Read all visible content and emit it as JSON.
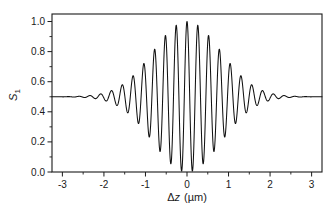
{
  "chart_data": {
    "type": "line",
    "title": "",
    "subtitle": "",
    "xlabel": "Δz (µm)",
    "xlabel_parts": {
      "delta": "Δ",
      "variable": "z",
      "unit": "(µm)"
    },
    "ylabel": "S1",
    "ylabel_parts": {
      "symbol": "S",
      "subscript": "1"
    },
    "xlim": [
      -3.25,
      3.25
    ],
    "ylim": [
      0.0,
      1.05
    ],
    "xticks": [
      -3,
      -2,
      -1,
      0,
      1,
      2,
      3
    ],
    "xticklabels": [
      "-3",
      "-2",
      "-1",
      "0",
      "1",
      "2",
      "3"
    ],
    "xminorticks": [
      -2.5,
      -1.5,
      -0.5,
      0.5,
      1.5,
      2.5
    ],
    "yticks": [
      0.0,
      0.2,
      0.4,
      0.6,
      0.8,
      1.0
    ],
    "yticklabels": [
      "0.0",
      "0.2",
      "0.4",
      "0.6",
      "0.8",
      "1.0"
    ],
    "grid": false,
    "legend": null,
    "legend_position": "none",
    "line_color": "#111111",
    "frame_color": "#1a1a1a",
    "background_color": "#ffffff",
    "series": [
      {
        "name": "S1 interferogram",
        "model": "baseline + amplitude * exp(-(x/sigma)^2) * cos(2*pi*x/period + phase)",
        "baseline": 0.5,
        "amplitude": 0.5,
        "sigma": 1.15,
        "period": 0.26,
        "phase": 0.0,
        "x_samples": [
          -3.25,
          3.25
        ],
        "peak_value": 1.0,
        "min_value": 0.0,
        "peak_x": 0.0,
        "tail_value": 0.5
      }
    ],
    "annotations": []
  },
  "figure": {
    "plot_left_px": 52,
    "plot_right_px": 322,
    "plot_top_px": 14,
    "plot_bottom_px": 172
  }
}
